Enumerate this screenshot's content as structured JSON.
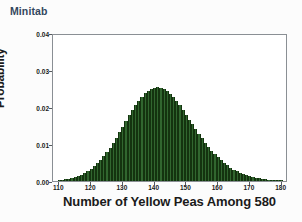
{
  "app": {
    "caption": "Minitab",
    "caption_color": "#33475e",
    "background_color": "#fcfcfc"
  },
  "chart_data": {
    "type": "bar",
    "title": "",
    "subtitle": "",
    "xlabel": "Number of Yellow Peas Among 580",
    "ylabel": "Probability",
    "xlim": [
      108,
      182
    ],
    "ylim": [
      0.0,
      0.04
    ],
    "xticks": [
      110,
      120,
      130,
      140,
      150,
      160,
      170,
      180
    ],
    "xtick_labels": [
      "110",
      "120",
      "130",
      "140",
      "150",
      "160",
      "170",
      "180"
    ],
    "yticks": [
      0.0,
      0.01,
      0.02,
      0.03,
      0.04
    ],
    "ytick_labels": [
      "0.00",
      "0.01",
      "0.02",
      "0.03",
      "0.04"
    ],
    "grid": false,
    "legend": null,
    "bar_color": "#31662f",
    "bar_edge_color": "#14330f",
    "distribution": "binomial",
    "n": 580,
    "p": 0.25,
    "mean": 145,
    "peak_value": 0.0382,
    "peak_category": 145,
    "categories": [
      110,
      111,
      112,
      113,
      114,
      115,
      116,
      117,
      118,
      119,
      120,
      121,
      122,
      123,
      124,
      125,
      126,
      127,
      128,
      129,
      130,
      131,
      132,
      133,
      134,
      135,
      136,
      137,
      138,
      139,
      140,
      141,
      142,
      143,
      144,
      145,
      146,
      147,
      148,
      149,
      150,
      151,
      152,
      153,
      154,
      155,
      156,
      157,
      158,
      159,
      160,
      161,
      162,
      163,
      164,
      165,
      166,
      167,
      168,
      169,
      170,
      171,
      172,
      173,
      174,
      175,
      176,
      177,
      178,
      179,
      180
    ],
    "values": [
      0.00026,
      0.00035,
      0.00047,
      0.00062,
      0.00081,
      0.00105,
      0.00134,
      0.0017,
      0.00213,
      0.00264,
      0.00324,
      0.00394,
      0.00474,
      0.00565,
      0.00667,
      0.0078,
      0.00903,
      0.01035,
      0.01176,
      0.01322,
      0.01472,
      0.01622,
      0.01771,
      0.01914,
      0.02049,
      0.02172,
      0.02281,
      0.02373,
      0.02445,
      0.02497,
      0.02527,
      0.02534,
      0.0252,
      0.02484,
      0.02427,
      0.02353,
      0.02262,
      0.02158,
      0.02043,
      0.0192,
      0.01792,
      0.01661,
      0.0153,
      0.014,
      0.01274,
      0.01152,
      0.01036,
      0.00927,
      0.00824,
      0.00729,
      0.00641,
      0.00561,
      0.00488,
      0.00422,
      0.00363,
      0.00311,
      0.00264,
      0.00223,
      0.00188,
      0.00157,
      0.00131,
      0.00108,
      0.00089,
      0.00073,
      0.00059,
      0.00048,
      0.00038,
      0.00031,
      0.00024,
      0.00019,
      0.00015
    ]
  }
}
